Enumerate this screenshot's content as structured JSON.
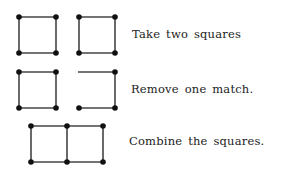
{
  "steps": [
    {
      "caption": "Take two squares"
    },
    {
      "caption": "Remove one match."
    },
    {
      "caption": "Combine the squares."
    }
  ],
  "colors": {
    "line": "#444444",
    "dot": "#111111",
    "text": "#222222",
    "background": "#ffffff"
  }
}
